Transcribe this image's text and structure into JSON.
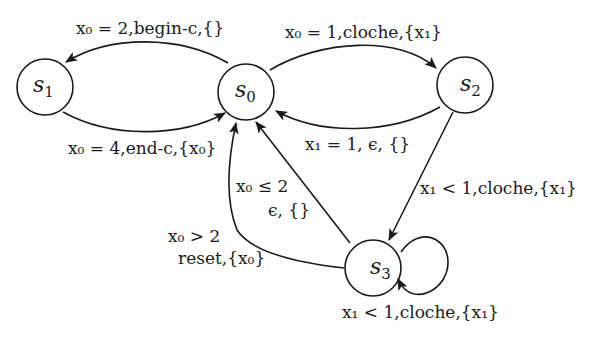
{
  "diagram": {
    "type": "timed-automaton",
    "stroke_color": "#1a1a1a",
    "background": "#ffffff",
    "nodes": [
      {
        "id": "s0",
        "name": "s",
        "sub": "0",
        "cx": 246,
        "cy": 92
      },
      {
        "id": "s1",
        "name": "s",
        "sub": "1",
        "cx": 45,
        "cy": 87
      },
      {
        "id": "s2",
        "name": "s",
        "sub": "2",
        "cx": 465,
        "cy": 85
      },
      {
        "id": "s3",
        "name": "s",
        "sub": "3",
        "cx": 373,
        "cy": 268
      }
    ],
    "edges": [
      {
        "from": "s0",
        "to": "s1",
        "label": "x₀ = 2,begin-c,{}"
      },
      {
        "from": "s1",
        "to": "s0",
        "label": "x₀ = 4,end-c,{x₀}"
      },
      {
        "from": "s0",
        "to": "s2",
        "label": "x₀ = 1,cloche,{x₁}"
      },
      {
        "from": "s2",
        "to": "s0",
        "label": "x₁ = 1, ϵ, {}"
      },
      {
        "from": "s2",
        "to": "s3",
        "label": "x₁ < 1,cloche,{x₁}"
      },
      {
        "from": "s3",
        "to": "s0",
        "label_line1": "x₀ ≤ 2",
        "label_line2": "ϵ, {}"
      },
      {
        "from": "s3",
        "to": "s0",
        "label_line1": "x₀ > 2",
        "label_line2": "reset,{x₀}"
      },
      {
        "from": "s3",
        "to": "s3",
        "label": "x₁ < 1,cloche,{x₁}"
      }
    ]
  }
}
